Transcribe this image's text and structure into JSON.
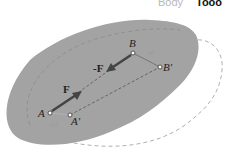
{
  "header": {
    "body_label": "Body",
    "cut_text": "Tooo"
  },
  "diagram": {
    "points": {
      "A": "A",
      "A_prime": "A'",
      "B": "B",
      "B_prime": "B'"
    },
    "forces": {
      "F": "F",
      "neg_F": "-F"
    },
    "small_labels": {
      "near_A": "(a)",
      "near_B": "dr'"
    },
    "colors": {
      "body_fill": "#9e9e9e",
      "outline_dashed": "#b0b0b0",
      "arrow": "#444444"
    }
  }
}
